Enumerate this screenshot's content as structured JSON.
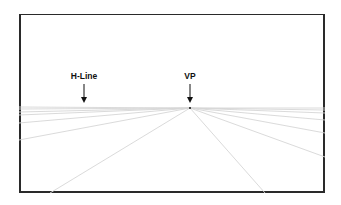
{
  "diagram": {
    "labels": {
      "hline": "H-Line",
      "vp": "VP"
    },
    "frame": {
      "x": 19,
      "y": 14,
      "width": 306,
      "height": 179,
      "border_color": "#2a2a2a"
    },
    "vanishing_point": {
      "x": 190,
      "y": 108
    },
    "line_color": "#d6d6d6",
    "perspective_lines": [
      {
        "to": [
          19,
          107
        ]
      },
      {
        "to": [
          19,
          109
        ]
      },
      {
        "to": [
          19,
          112
        ]
      },
      {
        "to": [
          19,
          115
        ]
      },
      {
        "to": [
          19,
          123
        ]
      },
      {
        "to": [
          19,
          140
        ]
      },
      {
        "to": [
          50,
          193
        ]
      },
      {
        "to": [
          265,
          193
        ]
      },
      {
        "to": [
          325,
          157
        ]
      },
      {
        "to": [
          325,
          133
        ]
      },
      {
        "to": [
          325,
          120
        ]
      },
      {
        "to": [
          325,
          113
        ]
      },
      {
        "to": [
          325,
          110
        ]
      },
      {
        "to": [
          325,
          108
        ]
      }
    ]
  }
}
